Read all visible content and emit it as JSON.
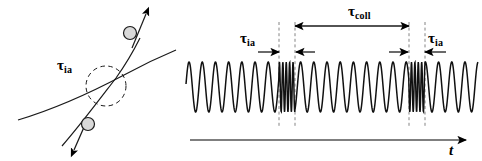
{
  "figure": {
    "title": "",
    "panels": [
      "collision-geometry",
      "time-signal"
    ]
  },
  "left_panel": {
    "name": "collision-geometry",
    "tau_ia_label": {
      "base": "τ",
      "sub": "ia"
    },
    "particles": [
      {
        "name": "upper-particle",
        "direction": "up-right"
      },
      {
        "name": "lower-particle",
        "direction": "down-left"
      }
    ],
    "interaction_region": "dashed-circle",
    "trajectories": [
      "curved-trajectory",
      "straight-trajectory"
    ]
  },
  "right_panel": {
    "name": "time-signal",
    "tau_coll_label": {
      "base": "τ",
      "sub": "coll"
    },
    "tau_ia_left_label": {
      "base": "τ",
      "sub": "ia"
    },
    "tau_ia_right_label": {
      "base": "τ",
      "sub": "ia"
    },
    "axis_label": "t",
    "axis_name": "time-axis"
  },
  "chart_data": {
    "type": "line",
    "title": "",
    "xlabel": "t",
    "ylabel": "",
    "baseline_period_px": 13.2,
    "burst_period_px": 3.4,
    "amplitude_px": 25,
    "wave_y_center": 87,
    "wave_x_start": 186,
    "wave_x_end": 478,
    "bursts": [
      {
        "name": "burst-1",
        "x_start": 279,
        "x_end": 295
      },
      {
        "name": "burst-2",
        "x_start": 409,
        "x_end": 425
      }
    ],
    "markers": {
      "tau_coll": {
        "from_x": 295,
        "to_x": 409,
        "y": 26
      },
      "tau_ia_left": {
        "from_x": 262,
        "to_x": 279,
        "y": 52
      },
      "tau_ia_right": {
        "from_x": 425,
        "to_x": 408,
        "y": 52
      },
      "dashed_guides_x": [
        279,
        295,
        409,
        425
      ]
    }
  }
}
